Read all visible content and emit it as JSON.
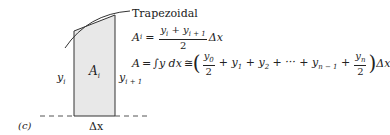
{
  "figure": {
    "panel_label": "(c)",
    "method_title": "Trapezoidal",
    "labels": {
      "left_height": "y",
      "left_height_sub": "i",
      "right_height": "y",
      "right_height_sub": "i + 1",
      "area": "A",
      "area_sub": "i",
      "width": "Δx"
    },
    "equations": {
      "eq1": {
        "lhs": "A",
        "lhs_sub": "i",
        "equals": "=",
        "numerator": "y_i + y_{i+1}",
        "denominator": "2",
        "suffix": "Δx"
      },
      "eq2": {
        "lhs": "A = ∫y dx ≅",
        "term0_num": "y_0",
        "term0_den": "2",
        "middle": "+ y_1 + y_2 + ··· + y_{n−1} +",
        "termn_num": "y_n",
        "termn_den": "2",
        "suffix": "Δx"
      }
    },
    "colors": {
      "fill": "#e8e8e8",
      "stroke": "#333333"
    }
  }
}
